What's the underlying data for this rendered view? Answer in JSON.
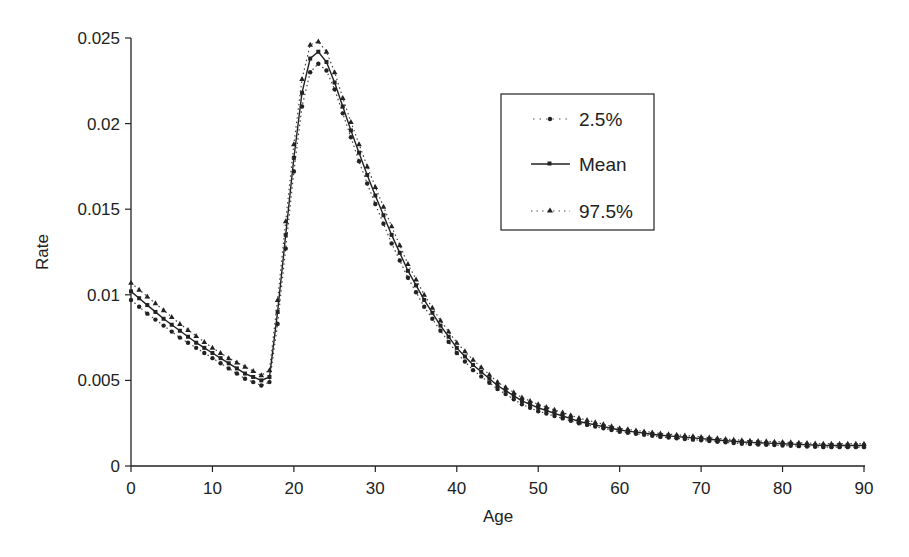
{
  "chart_data": {
    "type": "line",
    "title": "",
    "xlabel": "Age",
    "ylabel": "Rate",
    "xlim": [
      0,
      90
    ],
    "ylim": [
      0,
      0.025
    ],
    "xticks": [
      0,
      10,
      20,
      30,
      40,
      50,
      60,
      70,
      80,
      90
    ],
    "yticks": [
      0,
      0.005,
      0.01,
      0.015,
      0.02,
      0.025
    ],
    "ytick_labels": [
      "0",
      "0.005",
      "0.01",
      "0.015",
      "0.02",
      "0.025"
    ],
    "xtick_labels": [
      "0",
      "10",
      "20",
      "30",
      "40",
      "50",
      "60",
      "70",
      "80",
      "90"
    ],
    "grid": false,
    "legend_position": "upper-right-inset",
    "x": [
      0,
      2,
      4,
      6,
      8,
      10,
      12,
      14,
      16,
      17,
      18,
      19,
      20,
      21,
      22,
      23,
      24,
      25,
      26,
      27,
      28,
      29,
      30,
      32,
      34,
      36,
      38,
      40,
      42,
      45,
      48,
      50,
      55,
      60,
      65,
      70,
      75,
      80,
      85,
      90
    ],
    "series": [
      {
        "name": "2.5%",
        "style": "dotted-circle",
        "values": [
          0.0097,
          0.0089,
          0.0082,
          0.0075,
          0.0069,
          0.0063,
          0.0057,
          0.0051,
          0.0047,
          0.0049,
          0.0083,
          0.0127,
          0.0172,
          0.021,
          0.023,
          0.0235,
          0.0231,
          0.022,
          0.0206,
          0.0192,
          0.0178,
          0.0165,
          0.0153,
          0.013,
          0.011,
          0.0093,
          0.0079,
          0.0066,
          0.0056,
          0.0045,
          0.0036,
          0.0032,
          0.0025,
          0.002,
          0.0017,
          0.0015,
          0.0013,
          0.0012,
          0.0011,
          0.0011
        ]
      },
      {
        "name": "Mean",
        "style": "solid-square",
        "values": [
          0.0102,
          0.0094,
          0.0086,
          0.0079,
          0.0072,
          0.0066,
          0.006,
          0.0054,
          0.005,
          0.0052,
          0.009,
          0.0135,
          0.018,
          0.0218,
          0.0238,
          0.0242,
          0.0236,
          0.0224,
          0.021,
          0.0196,
          0.0183,
          0.017,
          0.0158,
          0.0135,
          0.0114,
          0.0097,
          0.0082,
          0.0069,
          0.0059,
          0.0047,
          0.0038,
          0.0034,
          0.0026,
          0.0021,
          0.0018,
          0.0016,
          0.0014,
          0.0013,
          0.0012,
          0.0012
        ]
      },
      {
        "name": "97.5%",
        "style": "dotted-triangle",
        "values": [
          0.0107,
          0.0099,
          0.0091,
          0.0083,
          0.0076,
          0.0069,
          0.0063,
          0.0058,
          0.0053,
          0.0056,
          0.0097,
          0.0143,
          0.0188,
          0.0226,
          0.0246,
          0.0248,
          0.0242,
          0.023,
          0.0215,
          0.0201,
          0.0188,
          0.0175,
          0.0163,
          0.014,
          0.0118,
          0.01,
          0.0085,
          0.0072,
          0.0062,
          0.0049,
          0.004,
          0.0036,
          0.0028,
          0.0022,
          0.0019,
          0.0017,
          0.0015,
          0.0014,
          0.0013,
          0.0013
        ]
      }
    ]
  },
  "legend": {
    "items": [
      {
        "label": "2.5%"
      },
      {
        "label": "Mean"
      },
      {
        "label": "97.5%"
      }
    ]
  },
  "axes": {
    "xlabel": "Age",
    "ylabel": "Rate"
  }
}
